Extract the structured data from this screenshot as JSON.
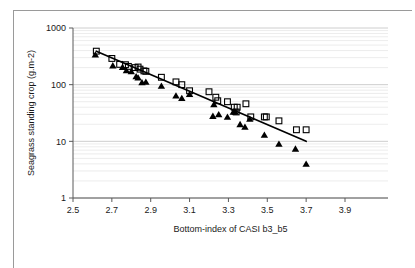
{
  "figure": {
    "background_color": "#ffffff",
    "frame_color": "#9a9a9a",
    "axis_color": "#5a5a5a",
    "grid_major_color": "#c8c8c8",
    "grid_minor_color": "#e4e4e4",
    "trendline_color": "#000000",
    "marker_square_color": "#000000",
    "marker_triangle_color": "#000000"
  },
  "chart_data": {
    "type": "scatter",
    "title": "",
    "xlabel": "Bottom-index of CASI b3_b5",
    "ylabel": "Seagrass standing crop (g.m-2)",
    "xlim": [
      2.5,
      3.9
    ],
    "ylim": [
      1,
      1000
    ],
    "yscale": "log",
    "xscale": "linear",
    "grid": true,
    "legend_position": "none",
    "xticks": [
      "2.5",
      "2.7",
      "2.9",
      "3.1",
      "3.3",
      "3.5",
      "3.7",
      "3.9"
    ],
    "xtick_values": [
      2.5,
      2.7,
      2.9,
      3.1,
      3.3,
      3.5,
      3.7,
      3.9
    ],
    "yticks": [
      "1000",
      "100",
      "10",
      "1"
    ],
    "ytick_values": [
      1000,
      100,
      10,
      1
    ],
    "series": [
      {
        "name": "open-square",
        "marker": "square-open",
        "points": [
          [
            2.62,
            390
          ],
          [
            2.7,
            290
          ],
          [
            2.74,
            228
          ],
          [
            2.77,
            225
          ],
          [
            2.785,
            210
          ],
          [
            2.82,
            200
          ],
          [
            2.835,
            205
          ],
          [
            2.845,
            188
          ],
          [
            2.865,
            175
          ],
          [
            2.875,
            172
          ],
          [
            2.955,
            135
          ],
          [
            3.03,
            112
          ],
          [
            3.06,
            100
          ],
          [
            3.1,
            78
          ],
          [
            3.2,
            75
          ],
          [
            3.235,
            60
          ],
          [
            3.245,
            52
          ],
          [
            3.295,
            50
          ],
          [
            3.33,
            40
          ],
          [
            3.345,
            40
          ],
          [
            3.34,
            33
          ],
          [
            3.39,
            46
          ],
          [
            3.415,
            27
          ],
          [
            3.485,
            27
          ],
          [
            3.495,
            27
          ],
          [
            3.56,
            23
          ],
          [
            3.65,
            16
          ],
          [
            3.7,
            16
          ]
        ]
      },
      {
        "name": "filled-triangle",
        "marker": "triangle-filled",
        "points": [
          [
            2.615,
            340
          ],
          [
            2.705,
            218
          ],
          [
            2.755,
            205
          ],
          [
            2.775,
            178
          ],
          [
            2.8,
            172
          ],
          [
            2.825,
            140
          ],
          [
            2.835,
            133
          ],
          [
            2.855,
            110
          ],
          [
            2.875,
            112
          ],
          [
            2.955,
            95
          ],
          [
            3.03,
            64
          ],
          [
            3.06,
            58
          ],
          [
            3.1,
            68
          ],
          [
            3.225,
            45
          ],
          [
            3.22,
            28
          ],
          [
            3.25,
            30
          ],
          [
            3.295,
            27
          ],
          [
            3.325,
            33
          ],
          [
            3.335,
            33
          ],
          [
            3.36,
            20
          ],
          [
            3.385,
            18
          ],
          [
            3.41,
            25
          ],
          [
            3.485,
            13
          ],
          [
            3.56,
            9
          ],
          [
            3.645,
            7.4
          ],
          [
            3.7,
            4
          ]
        ]
      }
    ],
    "trendline": {
      "name": "fitted-regression-line",
      "x_start": 2.62,
      "y_start": 390,
      "x_end": 3.7,
      "y_end": 10
    }
  }
}
